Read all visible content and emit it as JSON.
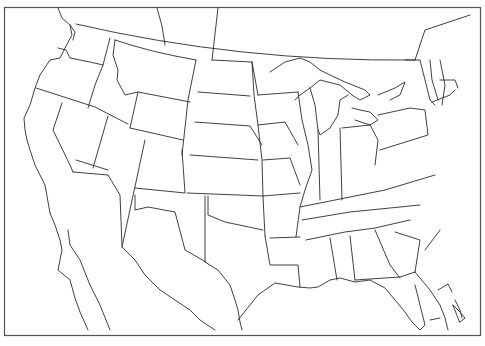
{
  "map": {
    "title": "Blank outline map of the contiguous United States with southern Canada and northern Mexico",
    "type": "outline-map",
    "labels_visible": false,
    "stroke_color": "#2a2a2a",
    "background_color": "#ffffff",
    "frame_color": "#555555",
    "regions_shown": [
      "United States (lower 48 states)",
      "Southern Canada",
      "Northern Mexico",
      "Gulf of Mexico",
      "Bahamas (partial)"
    ]
  }
}
